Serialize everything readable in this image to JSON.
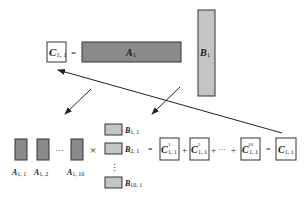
{
  "top": {
    "c_label": "C",
    "c_sub": "1, 1",
    "equals": "=",
    "a_label": "A",
    "a_sub": "1",
    "b_label": "B",
    "b_sub": "1"
  },
  "bottom": {
    "a_blocks": [
      {
        "label": "A",
        "sub": "1, 1"
      },
      {
        "label": "A",
        "sub": "1, 2"
      },
      {
        "label": "A",
        "sub": "1, 10"
      }
    ],
    "a_ellipsis": "···",
    "times": "×",
    "b_blocks": [
      {
        "label": "B",
        "sub": "1, 1"
      },
      {
        "label": "B",
        "sub": "2, 1"
      },
      {
        "label": "B",
        "sub": "10, 1"
      }
    ],
    "b_ellipsis": "⋮",
    "equals": "=",
    "partials": [
      {
        "label": "C",
        "sup": "1",
        "sub": "1, 1"
      },
      {
        "label": "C",
        "sup": "2",
        "sub": "1, 1"
      },
      {
        "label": "C",
        "sup": "10",
        "sub": "1, 1"
      }
    ],
    "plus": "+",
    "sum_ellipsis": "···",
    "result_equals": "=",
    "result": {
      "label": "C",
      "sub": "1, 1"
    }
  },
  "colors": {
    "a_fill": "#8a8a8a",
    "b_fill": "#c4c4c4",
    "stroke": "#333333",
    "box_fill": "#ffffff"
  }
}
